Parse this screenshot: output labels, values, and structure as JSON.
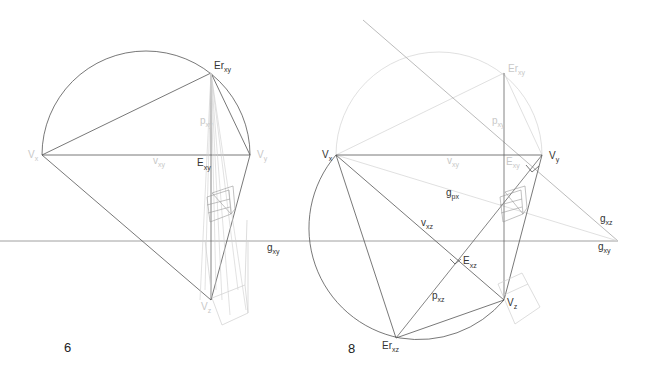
{
  "figures": [
    {
      "number": "6",
      "labels": {
        "er_xy": {
          "main": "Er",
          "sub": "xy"
        },
        "v_x": {
          "main": "V",
          "sub": "x"
        },
        "v_y": {
          "main": "V",
          "sub": "y"
        },
        "v_z": {
          "main": "V",
          "sub": "z"
        },
        "v_xy": {
          "main": "v",
          "sub": "xy"
        },
        "p_xy": {
          "main": "p",
          "sup": "*",
          "sub": "xy"
        },
        "e_xy": {
          "main": "E",
          "sup": "*",
          "sub": "xy"
        },
        "g_xy": {
          "main": "g",
          "sub": "xy"
        }
      }
    },
    {
      "number": "8",
      "labels": {
        "er_xy": {
          "main": "Er",
          "sub": "xy"
        },
        "v_x": {
          "main": "V",
          "sub": "x"
        },
        "v_y": {
          "main": "V",
          "sub": "y"
        },
        "v_z": {
          "main": "V",
          "sub": "z"
        },
        "v_xy": {
          "main": "v",
          "sub": "xy"
        },
        "v_xz": {
          "main": "v",
          "sub": "xz"
        },
        "p_xy": {
          "main": "p",
          "sup": "*",
          "sub": "xy"
        },
        "p_xz": {
          "main": "p",
          "sup": "*",
          "sub": "xz"
        },
        "e_xy": {
          "main": "E",
          "sup": "*",
          "sub": "xy"
        },
        "e_xz": {
          "main": "E",
          "sup": "*",
          "sub": "xz"
        },
        "er_xz": {
          "main": "Er",
          "sub": "xz"
        },
        "g_px": {
          "main": "g",
          "sub": "px"
        },
        "g_xz": {
          "main": "g",
          "sub": "xz"
        },
        "g_xy": {
          "main": "g",
          "sub": "xy"
        }
      }
    }
  ],
  "colors": {
    "line": "#555555",
    "faint": "#c8c8c8",
    "background": "#ffffff"
  }
}
